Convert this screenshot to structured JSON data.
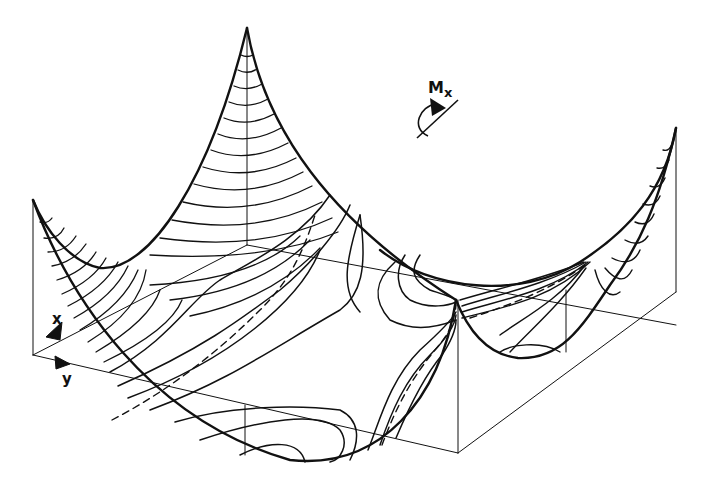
{
  "figure": {
    "type": "3D surface plot of bending moment distribution on a square plate",
    "colors": {
      "background": "#ffffff",
      "ink": "#111111"
    },
    "moment_label": "M",
    "moment_subscript": "x",
    "axis_x_label": "x",
    "axis_y_label": "y",
    "line_styles": [
      "solid contour lines",
      "dashed zero-moment contour lines"
    ]
  }
}
